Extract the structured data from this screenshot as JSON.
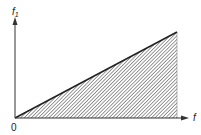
{
  "diagram": {
    "y_axis_label": "f",
    "y_axis_subscript": "1",
    "x_axis_label": "f",
    "origin_label": "0",
    "shaded_region": "triangle",
    "colors": {
      "line": "#222222",
      "hatch": "#444444",
      "background": "#ffffff"
    }
  }
}
